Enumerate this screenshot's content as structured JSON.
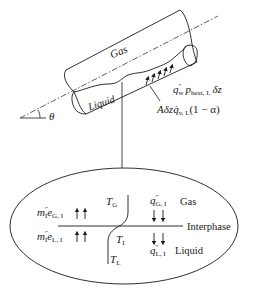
{
  "pipe": {
    "gas_label": "Gas",
    "liquid_label": "Liquid",
    "angle_label": "θ",
    "wall_heat": {
      "q": "q",
      "q_sup": "″",
      "q_sub": "w",
      "p": "p",
      "p_sub": "heat, L",
      "tail": "δz"
    },
    "volumetric_heat": {
      "prefix": "Aδz",
      "q": "q̇",
      "q_sub": "v, L",
      "tail": "(1 − α)"
    }
  },
  "interface_detail": {
    "gas_label": "Gas",
    "interphase_label": "Interphase",
    "liquid_label": "Liquid",
    "T_gas": {
      "T": "T",
      "sub": "G"
    },
    "T_interface": {
      "T": "T",
      "sub": "I"
    },
    "T_liquid": {
      "T": "T",
      "sub": "L"
    },
    "mass_energy_gas": {
      "m": "m",
      "m_sup": "″",
      "m_sub": "I",
      "e": "e",
      "e_sub": "G, I"
    },
    "mass_energy_liquid": {
      "m": "m",
      "m_sup": "″",
      "m_sub": "I",
      "e": "e",
      "e_sub": "L, I"
    },
    "heat_flux_gas": {
      "q": "q",
      "q_sup": "″",
      "q_sub": "G, I"
    },
    "heat_flux_liquid": {
      "q": "q",
      "q_sup": "″",
      "q_sub": "L, I"
    }
  },
  "colors": {
    "stroke": "#1a1a1a",
    "background": "#ffffff"
  }
}
